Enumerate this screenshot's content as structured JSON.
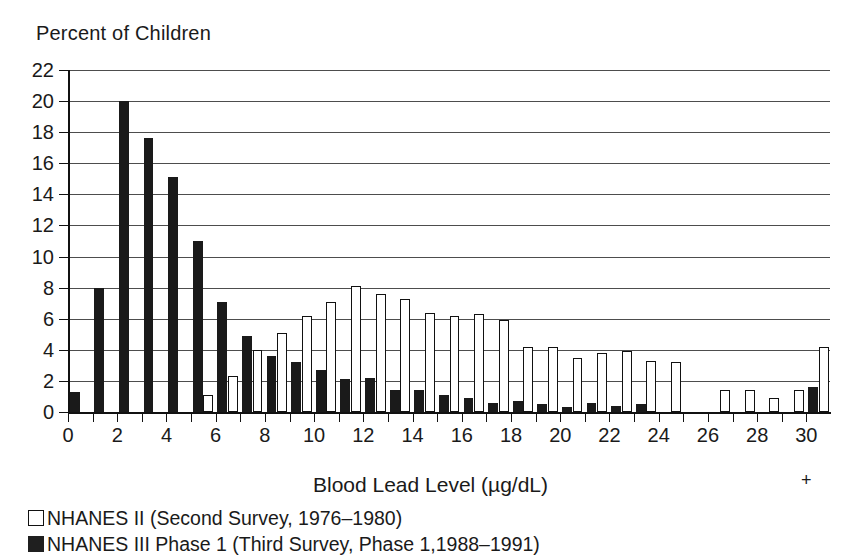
{
  "chart_data": {
    "type": "bar",
    "title": "",
    "ylabel": "Percent of Children",
    "xlabel": "Blood Lead Level (µg/dL)",
    "ylim": [
      0,
      22
    ],
    "ytick_step": 2,
    "yticks": [
      0,
      2,
      4,
      6,
      8,
      10,
      12,
      14,
      16,
      18,
      20,
      22
    ],
    "xlim": [
      0,
      31
    ],
    "xticks": [
      0,
      1,
      2,
      3,
      4,
      5,
      6,
      7,
      8,
      9,
      10,
      11,
      12,
      13,
      14,
      15,
      16,
      17,
      18,
      19,
      20,
      21,
      22,
      23,
      24,
      25,
      26,
      27,
      28,
      29,
      30
    ],
    "xtick_labels": [
      "0",
      "",
      "2",
      "",
      "4",
      "",
      "6",
      "",
      "8",
      "",
      "10",
      "",
      "12",
      "",
      "14",
      "",
      "16",
      "",
      "18",
      "",
      "20",
      "",
      "22",
      "",
      "24",
      "",
      "26",
      "",
      "28",
      "",
      "30"
    ],
    "xtick_suffix": "+",
    "grid": "horizontal",
    "legend_position": "below-left",
    "bin_width": 1,
    "bin_starts": [
      0,
      1,
      2,
      3,
      4,
      5,
      6,
      7,
      8,
      9,
      10,
      11,
      12,
      13,
      14,
      15,
      16,
      17,
      18,
      19,
      20,
      21,
      22,
      23,
      24,
      25,
      26,
      27,
      28,
      29,
      30
    ],
    "series": [
      {
        "name": "NHANES II (Second Survey, 1976–1980)",
        "style": "open",
        "color": "#ffffff",
        "edge_color": "#111111",
        "values": [
          0,
          0,
          0,
          0,
          0,
          1.1,
          2.3,
          4.0,
          5.1,
          6.2,
          7.1,
          8.1,
          7.6,
          7.3,
          6.4,
          6.2,
          6.3,
          5.9,
          4.2,
          4.2,
          3.5,
          3.8,
          3.9,
          3.3,
          3.2,
          0,
          1.4,
          1.4,
          0.9,
          1.4,
          4.2
        ]
      },
      {
        "name": "NHANES III Phase 1 (Third Survey, Phase 1,1988–1991)",
        "style": "solid",
        "color": "#1a1a1a",
        "edge_color": "#1a1a1a",
        "values": [
          1.3,
          8.0,
          20.0,
          17.6,
          15.1,
          11.0,
          7.1,
          4.9,
          3.6,
          3.2,
          2.7,
          2.1,
          2.2,
          1.4,
          1.4,
          1.1,
          0.9,
          0.6,
          0.7,
          0.5,
          0.3,
          0.6,
          0.4,
          0.5,
          0,
          0,
          0,
          0,
          0,
          0,
          1.6
        ]
      }
    ]
  },
  "legend": {
    "items": [
      {
        "label": "NHANES II (Second Survey, 1976–1980)",
        "style": "open"
      },
      {
        "label": "NHANES III Phase 1 (Third Survey, Phase 1,1988–1991)",
        "style": "solid"
      }
    ]
  }
}
